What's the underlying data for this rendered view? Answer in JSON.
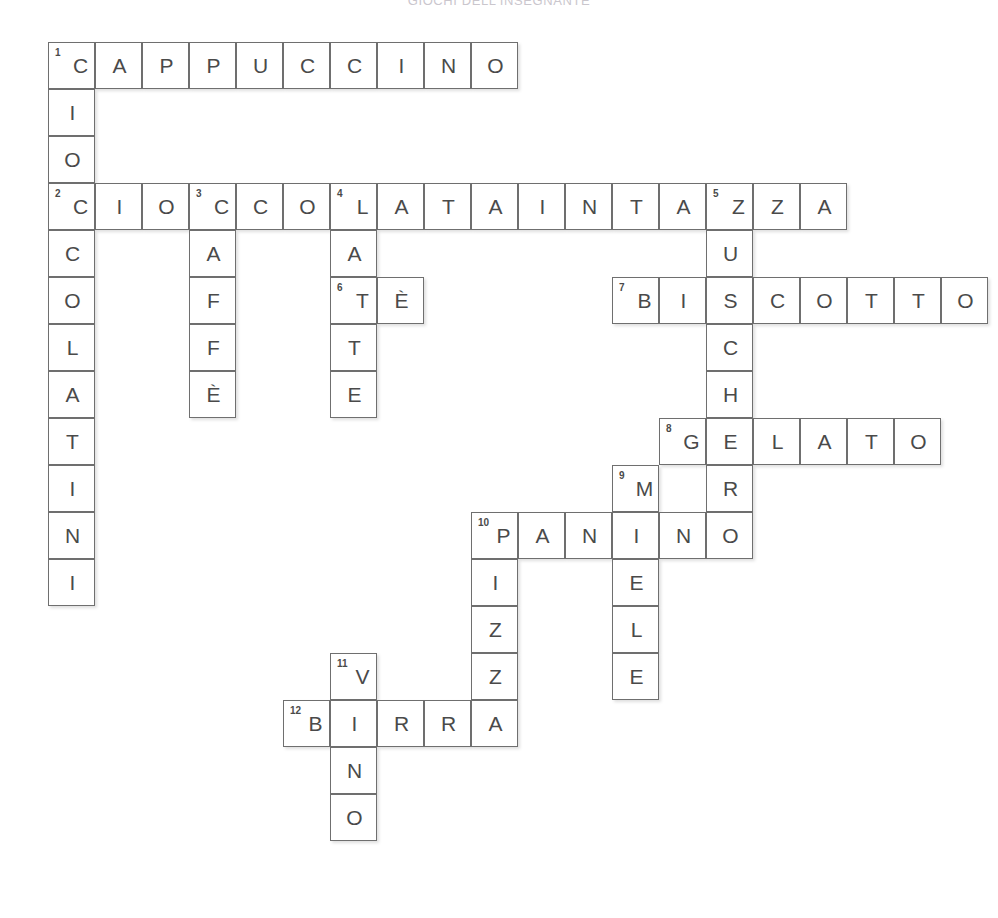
{
  "page": {
    "heading": "GIOCHI DELL'INSEGNANTE",
    "grid": {
      "origin_x": 48,
      "origin_y": 42,
      "cell_size": 47,
      "ink_color": "#4a4a4a",
      "border_color": "#6f6f6f"
    }
  },
  "crossword": {
    "type": "filled-crossword",
    "columns": 20,
    "rows": 18,
    "entries": [
      {
        "number": "1",
        "direction": "across",
        "answer": "CAPPUCCINO",
        "row": 0,
        "col": 0
      },
      {
        "number": "1",
        "direction": "down",
        "answer": "CIOCCOLATINI",
        "row": 0,
        "col": 0
      },
      {
        "number": "2",
        "direction": "across",
        "answer": "CIOCCOLATAINTAZZA",
        "row": 3,
        "col": 0
      },
      {
        "number": "3",
        "direction": "down",
        "answer": "CAFFE",
        "row": 3,
        "col": 3
      },
      {
        "number": "4",
        "direction": "down",
        "answer": "LATTE",
        "row": 3,
        "col": 6
      },
      {
        "number": "5",
        "direction": "down",
        "answer": "ZUCCHERO",
        "row": 3,
        "col": 14
      },
      {
        "number": "6",
        "direction": "across",
        "answer": "TE",
        "row": 5,
        "col": 6
      },
      {
        "number": "7",
        "direction": "across",
        "answer": "BISCOTTO",
        "row": 5,
        "col": 12
      },
      {
        "number": "8",
        "direction": "across",
        "answer": "GELATO",
        "row": 8,
        "col": 14
      },
      {
        "number": "9",
        "direction": "down",
        "answer": "MIELE",
        "row": 9,
        "col": 12
      },
      {
        "number": "10",
        "direction": "across",
        "answer": "PANINO",
        "row": 10,
        "col": 9
      },
      {
        "number": "10",
        "direction": "down",
        "answer": "PIZZA",
        "row": 10,
        "col": 9
      },
      {
        "number": "11",
        "direction": "down",
        "answer": "VINO",
        "row": 13,
        "col": 6
      },
      {
        "number": "12",
        "direction": "across",
        "answer": "BIRRA",
        "row": 14,
        "col": 5
      }
    ],
    "cells": [
      {
        "row": 0,
        "col": 0,
        "letter": "C",
        "number": "1"
      },
      {
        "row": 0,
        "col": 1,
        "letter": "A"
      },
      {
        "row": 0,
        "col": 2,
        "letter": "P"
      },
      {
        "row": 0,
        "col": 3,
        "letter": "P"
      },
      {
        "row": 0,
        "col": 4,
        "letter": "U"
      },
      {
        "row": 0,
        "col": 5,
        "letter": "C"
      },
      {
        "row": 0,
        "col": 6,
        "letter": "C"
      },
      {
        "row": 0,
        "col": 7,
        "letter": "I"
      },
      {
        "row": 0,
        "col": 8,
        "letter": "N"
      },
      {
        "row": 0,
        "col": 9,
        "letter": "O"
      },
      {
        "row": 1,
        "col": 0,
        "letter": "I"
      },
      {
        "row": 2,
        "col": 0,
        "letter": "O"
      },
      {
        "row": 3,
        "col": 0,
        "letter": "C",
        "number": "2"
      },
      {
        "row": 3,
        "col": 1,
        "letter": "I"
      },
      {
        "row": 3,
        "col": 2,
        "letter": "O"
      },
      {
        "row": 3,
        "col": 3,
        "letter": "C",
        "number": "3"
      },
      {
        "row": 3,
        "col": 4,
        "letter": "C"
      },
      {
        "row": 3,
        "col": 5,
        "letter": "O"
      },
      {
        "row": 3,
        "col": 6,
        "letter": "L",
        "number": "4"
      },
      {
        "row": 3,
        "col": 7,
        "letter": "A"
      },
      {
        "row": 3,
        "col": 8,
        "letter": "T"
      },
      {
        "row": 3,
        "col": 9,
        "letter": "A"
      },
      {
        "row": 3,
        "col": 10,
        "letter": "I"
      },
      {
        "row": 3,
        "col": 11,
        "letter": "N"
      },
      {
        "row": 3,
        "col": 12,
        "letter": "T"
      },
      {
        "row": 3,
        "col": 13,
        "letter": "A"
      },
      {
        "row": 3,
        "col": 14,
        "letter": "Z",
        "number": "5"
      },
      {
        "row": 3,
        "col": 15,
        "letter": "Z"
      },
      {
        "row": 3,
        "col": 16,
        "letter": "A"
      },
      {
        "row": 4,
        "col": 0,
        "letter": "C"
      },
      {
        "row": 4,
        "col": 3,
        "letter": "A"
      },
      {
        "row": 4,
        "col": 6,
        "letter": "A"
      },
      {
        "row": 4,
        "col": 14,
        "letter": "U"
      },
      {
        "row": 5,
        "col": 0,
        "letter": "O"
      },
      {
        "row": 5,
        "col": 3,
        "letter": "F"
      },
      {
        "row": 5,
        "col": 6,
        "letter": "T",
        "number": "6"
      },
      {
        "row": 5,
        "col": 7,
        "letter": "È"
      },
      {
        "row": 5,
        "col": 12,
        "letter": "B",
        "number": "7"
      },
      {
        "row": 5,
        "col": 13,
        "letter": "I"
      },
      {
        "row": 5,
        "col": 14,
        "letter": "S"
      },
      {
        "row": 5,
        "col": 15,
        "letter": "C"
      },
      {
        "row": 5,
        "col": 16,
        "letter": "O"
      },
      {
        "row": 5,
        "col": 17,
        "letter": "T"
      },
      {
        "row": 5,
        "col": 18,
        "letter": "T"
      },
      {
        "row": 5,
        "col": 19,
        "letter": "O"
      },
      {
        "row": 6,
        "col": 0,
        "letter": "L"
      },
      {
        "row": 6,
        "col": 3,
        "letter": "F"
      },
      {
        "row": 6,
        "col": 6,
        "letter": "T"
      },
      {
        "row": 6,
        "col": 14,
        "letter": "C"
      },
      {
        "row": 7,
        "col": 0,
        "letter": "A"
      },
      {
        "row": 7,
        "col": 3,
        "letter": "È"
      },
      {
        "row": 7,
        "col": 6,
        "letter": "E"
      },
      {
        "row": 7,
        "col": 14,
        "letter": "H"
      },
      {
        "row": 8,
        "col": 0,
        "letter": "T"
      },
      {
        "row": 8,
        "col": 13,
        "letter": "G",
        "number": "8"
      },
      {
        "row": 8,
        "col": 14,
        "letter": "E"
      },
      {
        "row": 8,
        "col": 15,
        "letter": "L"
      },
      {
        "row": 8,
        "col": 16,
        "letter": "A"
      },
      {
        "row": 8,
        "col": 17,
        "letter": "T"
      },
      {
        "row": 8,
        "col": 18,
        "letter": "O"
      },
      {
        "row": 9,
        "col": 0,
        "letter": "I"
      },
      {
        "row": 9,
        "col": 12,
        "letter": "M",
        "number": "9"
      },
      {
        "row": 9,
        "col": 14,
        "letter": "R"
      },
      {
        "row": 10,
        "col": 0,
        "letter": "N"
      },
      {
        "row": 10,
        "col": 9,
        "letter": "P",
        "number": "10"
      },
      {
        "row": 10,
        "col": 10,
        "letter": "A"
      },
      {
        "row": 10,
        "col": 11,
        "letter": "N"
      },
      {
        "row": 10,
        "col": 12,
        "letter": "I"
      },
      {
        "row": 10,
        "col": 13,
        "letter": "N"
      },
      {
        "row": 10,
        "col": 14,
        "letter": "O"
      },
      {
        "row": 11,
        "col": 0,
        "letter": "I"
      },
      {
        "row": 11,
        "col": 9,
        "letter": "I"
      },
      {
        "row": 11,
        "col": 12,
        "letter": "E"
      },
      {
        "row": 12,
        "col": 9,
        "letter": "Z"
      },
      {
        "row": 12,
        "col": 12,
        "letter": "L"
      },
      {
        "row": 13,
        "col": 6,
        "letter": "V",
        "number": "11"
      },
      {
        "row": 13,
        "col": 9,
        "letter": "Z"
      },
      {
        "row": 13,
        "col": 12,
        "letter": "E"
      },
      {
        "row": 14,
        "col": 5,
        "letter": "B",
        "number": "12"
      },
      {
        "row": 14,
        "col": 6,
        "letter": "I"
      },
      {
        "row": 14,
        "col": 7,
        "letter": "R"
      },
      {
        "row": 14,
        "col": 8,
        "letter": "R"
      },
      {
        "row": 14,
        "col": 9,
        "letter": "A"
      },
      {
        "row": 15,
        "col": 6,
        "letter": "N"
      },
      {
        "row": 16,
        "col": 6,
        "letter": "O"
      }
    ]
  }
}
